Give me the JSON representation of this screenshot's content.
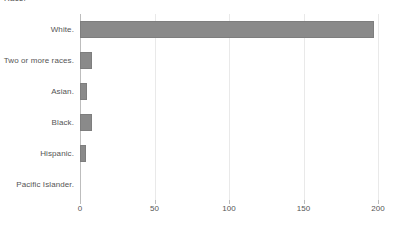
{
  "chart_data": {
    "type": "bar",
    "orientation": "horizontal",
    "title": "Race.",
    "xlabel": "",
    "ylabel": "",
    "categories": [
      "White.",
      "Two or more races.",
      "Asian.",
      "Black.",
      "Hispanic.",
      "Pacific Islander."
    ],
    "values": [
      197,
      8,
      5,
      8,
      4,
      0
    ],
    "xlim": [
      0,
      200
    ],
    "xticks": [
      0,
      50,
      100,
      150,
      200
    ],
    "xtick_labels": [
      "0",
      "50",
      "100",
      "150",
      "200"
    ],
    "grid": true,
    "grid_axis": "x",
    "legend": false,
    "bar_color": "#8a8a8a",
    "gridline_color": "#e9e9e9",
    "axis_color": "#bdbdbd",
    "text_color": "#555555",
    "background_color": "#ffffff"
  }
}
